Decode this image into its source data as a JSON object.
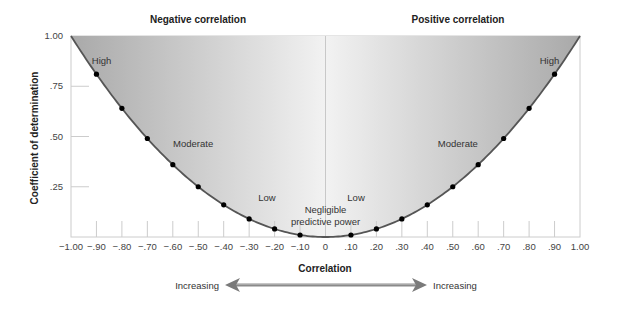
{
  "chart_data": {
    "type": "area",
    "title_left": "Negative correlation",
    "title_right": "Positive correlation",
    "xlabel": "Correlation",
    "ylabel": "Coefficient of determination",
    "x_ticks": [
      "-1.00",
      "-.90",
      "-.80",
      "-.70",
      "-.60",
      "-.50",
      "-.40",
      "-.30",
      "-.20",
      "-.10",
      "0",
      ".10",
      ".20",
      ".30",
      ".40",
      ".50",
      ".60",
      ".70",
      ".80",
      ".90",
      "1.00"
    ],
    "y_ticks": [
      ".25",
      ".50",
      ".75",
      "1.00"
    ],
    "xlim": [
      -1.0,
      1.0
    ],
    "ylim": [
      0,
      1.0
    ],
    "grid": false,
    "curve": "y = x^2",
    "series": [
      {
        "name": "Coefficient of determination (r squared)",
        "x": [
          -0.9,
          -0.8,
          -0.7,
          -0.6,
          -0.5,
          -0.4,
          -0.3,
          -0.2,
          -0.1,
          0.1,
          0.2,
          0.3,
          0.4,
          0.5,
          0.6,
          0.7,
          0.8,
          0.9
        ],
        "y": [
          0.81,
          0.64,
          0.49,
          0.36,
          0.25,
          0.16,
          0.09,
          0.04,
          0.01,
          0.01,
          0.04,
          0.09,
          0.16,
          0.25,
          0.36,
          0.49,
          0.64,
          0.81
        ]
      }
    ],
    "annotations": [
      {
        "text": "High",
        "x": -0.88,
        "y": 0.86
      },
      {
        "text": "Moderate",
        "x": -0.52,
        "y": 0.45
      },
      {
        "text": "Low",
        "x": -0.23,
        "y": 0.18
      },
      {
        "text": "Low",
        "x": 0.12,
        "y": 0.18
      },
      {
        "text": "Negligible",
        "x": 0.0,
        "y": 0.12
      },
      {
        "text": "predictive power",
        "x": 0.0,
        "y": 0.06
      },
      {
        "text": "Moderate",
        "x": 0.52,
        "y": 0.45
      },
      {
        "text": "High",
        "x": 0.88,
        "y": 0.86
      }
    ],
    "arrow": {
      "left_label": "Increasing",
      "right_label": "Increasing"
    },
    "colors": {
      "fill_dark": "#a9a9a9",
      "fill_light": "#f2f2f2",
      "curve": "#555555",
      "point": "#000000",
      "axis": "#cccccc"
    }
  }
}
